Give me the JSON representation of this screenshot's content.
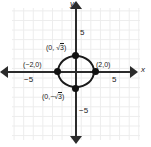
{
  "chart_data": {
    "type": "scatter",
    "title": "",
    "xlabel": "x",
    "ylabel": "y",
    "xlim": [
      -7,
      7
    ],
    "ylim": [
      -7,
      7
    ],
    "grid": true,
    "legend": false,
    "x_ticks": [
      "-5",
      "5"
    ],
    "y_ticks": [
      "5",
      "-5"
    ],
    "curves": [
      {
        "name": "ellipse",
        "equation": "x^2/4 + y^2/3 = 1",
        "semi_axis_x": 2,
        "semi_axis_y": 1.732,
        "center": [
          0,
          0
        ]
      }
    ],
    "points": [
      {
        "name": "top-vertex",
        "x": 0,
        "y": 1.732,
        "label": "(0, √3)"
      },
      {
        "name": "right-vertex",
        "x": 2,
        "y": 0,
        "label": "(2,0)"
      },
      {
        "name": "bottom-vertex",
        "x": 0,
        "y": -1.732,
        "label": "(0,−√3)"
      },
      {
        "name": "left-vertex",
        "x": -2,
        "y": 0,
        "label": "(−2,0)"
      }
    ]
  },
  "axes": {
    "x_name": "x",
    "y_name": "y",
    "x_tick_negative": "−5",
    "x_tick_positive": "5",
    "y_tick_positive": "5",
    "y_tick_negative": "−5"
  },
  "labels": {
    "top_vertex_prefix": "(0, ",
    "top_vertex_radical": "3",
    "top_vertex_suffix": ")",
    "bottom_vertex_prefix": "(0,−",
    "bottom_vertex_radical": "3",
    "bottom_vertex_suffix": ")",
    "left_vertex": "(−2,0)",
    "right_vertex": "(2,0)"
  },
  "colors": {
    "grid": "#ececec",
    "axis": "#2b2b2b",
    "curve": "#1a1a1a",
    "point": "#111111",
    "background": "#ffffff"
  }
}
